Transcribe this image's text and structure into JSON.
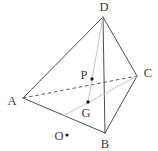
{
  "figure": {
    "width": 158,
    "height": 151,
    "colors": {
      "background": "#ffffff",
      "edge": "#4d4d4d",
      "hidden_edge": "#5a5a5a",
      "construction_line": "#c2c2c2",
      "label": "#3d3d3d",
      "dot": "#1f1f1f"
    },
    "points": {
      "A": {
        "x": 23,
        "y": 98
      },
      "B": {
        "x": 105,
        "y": 133
      },
      "C": {
        "x": 137,
        "y": 76
      },
      "D": {
        "x": 103,
        "y": 17
      },
      "G": {
        "x": 88,
        "y": 102
      },
      "P": {
        "x": 92,
        "y": 79
      },
      "O": {
        "x": 67,
        "y": 135
      },
      "M_AB": {
        "x": 64,
        "y": 115.5
      }
    },
    "edges": [
      {
        "from": "A",
        "to": "D",
        "style": "solid"
      },
      {
        "from": "D",
        "to": "C",
        "style": "solid"
      },
      {
        "from": "A",
        "to": "B",
        "style": "solid"
      },
      {
        "from": "B",
        "to": "C",
        "style": "solid"
      },
      {
        "from": "D",
        "to": "B",
        "style": "solid"
      },
      {
        "from": "A",
        "to": "C",
        "style": "dashed"
      },
      {
        "from": "D",
        "to": "G",
        "style": "faint"
      },
      {
        "from": "C",
        "to": "M_AB",
        "style": "faint"
      }
    ],
    "dots": [
      {
        "point": "P",
        "r": 1.7
      },
      {
        "point": "G",
        "r": 1.7
      },
      {
        "point": "O",
        "r": 1.6
      }
    ],
    "labels": [
      {
        "text": "D",
        "x": 104,
        "y": 7
      },
      {
        "text": "A",
        "x": 12,
        "y": 101
      },
      {
        "text": "B",
        "x": 105,
        "y": 144
      },
      {
        "text": "C",
        "x": 148,
        "y": 73
      },
      {
        "text": "P",
        "x": 84,
        "y": 75
      },
      {
        "text": "G",
        "x": 86,
        "y": 113
      },
      {
        "text": "O",
        "x": 59,
        "y": 136
      }
    ]
  }
}
